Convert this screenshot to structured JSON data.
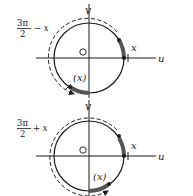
{
  "diagrams": [
    {
      "angle_label_num": "3π",
      "angle_label_den": "2",
      "angle_label_op": "− x",
      "angle_full": "3π/2 − x",
      "axis_u": "u",
      "axis_v": "v",
      "origin": "O",
      "arc_label": "x",
      "image_arc_label": "(x)",
      "center": [
        89,
        58
      ],
      "radius": 35,
      "dashed_radius": 39
    },
    {
      "angle_label_num": "3π",
      "angle_label_den": "2",
      "angle_label_op": "+ x",
      "angle_full": "3π/2 + x",
      "axis_u": "u",
      "axis_v": "v",
      "origin": "O",
      "arc_label": "x",
      "image_arc_label": "(x)",
      "center": [
        89,
        156
      ],
      "radius": 35,
      "dashed_radius": 39
    }
  ],
  "colors": {
    "ink": "#1a1a1a",
    "arc_fill": "#555555"
  }
}
